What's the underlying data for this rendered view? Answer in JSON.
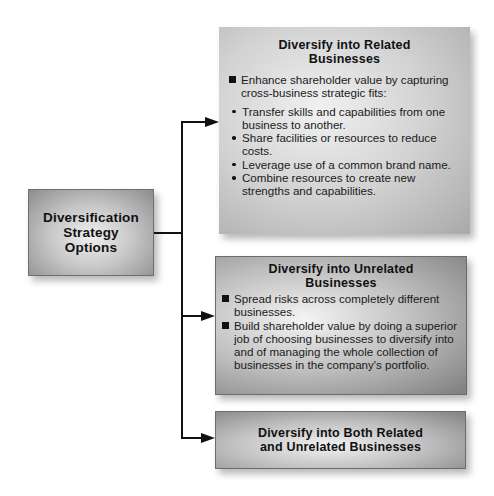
{
  "root": {
    "title": "Diversification\nStrategy\nOptions"
  },
  "options": [
    {
      "title": "Diversify into Related\nBusinesses",
      "points": [
        {
          "text": "Enhance shareholder value by capturing cross-business strategic fits:",
          "subpoints": [
            "Transfer skills and capabilities from one business to another.",
            "Share facilities or resources to reduce costs.",
            "Leverage use of a common brand name.",
            "Combine resources to create new strengths and capabilities."
          ]
        }
      ]
    },
    {
      "title": "Diversify into Unrelated\nBusinesses",
      "points": [
        {
          "text": "Spread risks across completely different businesses."
        },
        {
          "text": "Build shareholder value by doing a superior job of choosing businesses to diversify into and of managing the whole collection of businesses in the company's portfolio."
        }
      ]
    },
    {
      "title": "Diversify into Both Related\nand Unrelated Businesses"
    }
  ],
  "colors": {
    "connector": "#111111",
    "box_dark": "#7e7e7e",
    "box_light": "#f2f2f2",
    "background": "#ffffff"
  }
}
